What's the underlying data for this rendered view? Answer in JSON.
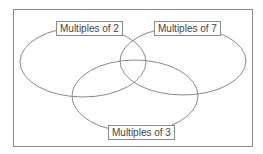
{
  "diagram": {
    "type": "venn",
    "sets": [
      {
        "id": "A",
        "label": "Multiples of 2"
      },
      {
        "id": "B",
        "label": "Multiples of 7"
      },
      {
        "id": "C",
        "label": "Multiples of 3"
      }
    ],
    "colors": {
      "outline": "#8a8a8a",
      "text": "#444444",
      "background": "#ffffff"
    }
  }
}
